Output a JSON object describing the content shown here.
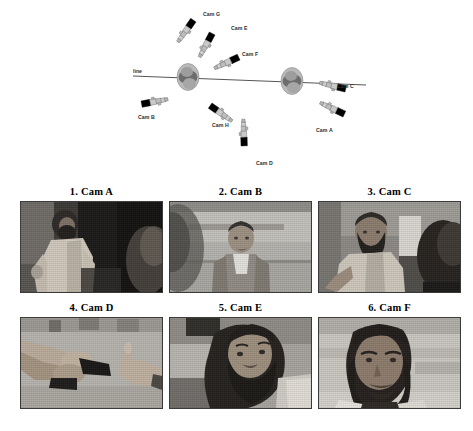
{
  "figure": {
    "watermark": "",
    "diagram": {
      "line_label": "line",
      "cameras": [
        {
          "id": "Cam G",
          "label": "Cam G",
          "x": 218,
          "y": 13,
          "cam_x": 196,
          "cam_y": 22,
          "angle": 125
        },
        {
          "id": "Cam E",
          "label": "Cam E",
          "x": 243,
          "y": 27,
          "cam_x": 213,
          "cam_y": 34,
          "angle": 120
        },
        {
          "id": "Cam F",
          "label": "Cam F",
          "x": 253,
          "y": 52,
          "cam_x": 243,
          "cam_y": 62,
          "angle": 158
        },
        {
          "id": "Cam C",
          "label": "Cam C",
          "x": 336,
          "y": 82,
          "cam_x": 318,
          "cam_y": 88,
          "angle": 200
        },
        {
          "id": "Cam A",
          "label": "Cam A",
          "x": 318,
          "y": 125,
          "cam_x": 318,
          "cam_y": 107,
          "angle": 213
        },
        {
          "id": "Cam B",
          "label": "Cam B",
          "x": 139,
          "y": 117,
          "cam_x": 148,
          "cam_y": 101,
          "angle": 347
        },
        {
          "id": "Cam H",
          "label": "Cam H",
          "x": 213,
          "y": 127,
          "cam_x": 212,
          "cam_y": 106,
          "angle": 28
        },
        {
          "id": "Cam D",
          "label": "Cam D",
          "x": 260,
          "y": 163,
          "cam_x": 237,
          "cam_y": 142,
          "angle": 90
        }
      ],
      "subjects": [
        {
          "name": "subject-left",
          "x": 188,
          "y": 77
        },
        {
          "name": "subject-right",
          "x": 292,
          "y": 81
        }
      ]
    },
    "panels": [
      {
        "number": "1",
        "camera": "Cam A",
        "caption": "1. Cam A",
        "description": "bearded man in light shirt standing with hand on hip, dark doorway behind",
        "tone": "dark"
      },
      {
        "number": "2",
        "camera": "Cam B",
        "caption": "2. Cam B",
        "description": "man facing camera wearing plaid shirt, bright wall background",
        "tone": "light"
      },
      {
        "number": "3",
        "camera": "Cam C",
        "caption": "3. Cam C",
        "description": "bearded man reaching arm toward second person seen from behind",
        "tone": "mid"
      },
      {
        "number": "4",
        "camera": "Cam D",
        "caption": "4. Cam D",
        "description": "close-up of two pairs of hands exchanging a dark object",
        "tone": "light"
      },
      {
        "number": "5",
        "camera": "Cam E",
        "caption": "5. Cam E",
        "description": "close-up profile of heavily bearded man looking down-left",
        "tone": "mid"
      },
      {
        "number": "6",
        "camera": "Cam F",
        "caption": "6. Cam F",
        "description": "frontal portrait of dark-haired man against bright background",
        "tone": "light"
      }
    ]
  }
}
